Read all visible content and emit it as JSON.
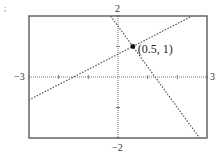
{
  "chart_data": {
    "type": "line",
    "title": "",
    "xlabel": "",
    "ylabel": "",
    "xlim": [
      -3,
      3
    ],
    "ylim": [
      -2,
      2
    ],
    "xtick_step": 1,
    "ytick_step": 1,
    "axis_labels": {
      "xmin": "−3",
      "xmax": "3",
      "ymin": "−2",
      "ymax": "2"
    },
    "grid": false,
    "series": [
      {
        "name": "line-rising",
        "slope": 0.5,
        "intercept": 0.75,
        "style": "dotted"
      },
      {
        "name": "line-falling",
        "slope": -1.3333,
        "intercept": 1.6667,
        "style": "dotted"
      }
    ],
    "annotations": [
      {
        "x": 0.5,
        "y": 1,
        "text": "(0.5, 1)",
        "marker": "filled-circle"
      }
    ]
  },
  "corner_mark": ";"
}
